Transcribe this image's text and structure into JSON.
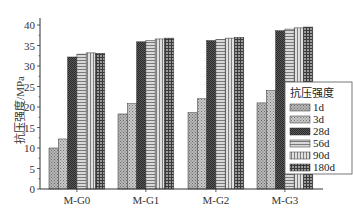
{
  "chart_data": {
    "type": "bar",
    "title": "",
    "xlabel": "",
    "ylabel": "抗压强度/MPa",
    "ylim": [
      0,
      42
    ],
    "yticks": [
      0,
      5,
      10,
      15,
      20,
      25,
      30,
      35,
      40
    ],
    "grid": false,
    "legend_position": "right-inside",
    "legend_title": "抗压强度",
    "categories": [
      "M-G0",
      "M-G1",
      "M-G2",
      "M-G3"
    ],
    "series": [
      {
        "name": "1d",
        "values": [
          10.0,
          18.3,
          18.6,
          21.0
        ],
        "pattern": "dots-light"
      },
      {
        "name": "3d",
        "values": [
          12.2,
          20.8,
          22.0,
          24.0
        ],
        "pattern": "dots-lighter"
      },
      {
        "name": "28d",
        "values": [
          32.2,
          35.9,
          36.2,
          38.6
        ],
        "pattern": "checker-dark"
      },
      {
        "name": "56d",
        "values": [
          32.9,
          36.2,
          36.5,
          39.0
        ],
        "pattern": "horizontal-lines"
      },
      {
        "name": "90d",
        "values": [
          33.2,
          36.6,
          36.8,
          39.3
        ],
        "pattern": "vertical-lines"
      },
      {
        "name": "180d",
        "values": [
          33.1,
          36.8,
          37.0,
          39.5
        ],
        "pattern": "grid-dark"
      }
    ]
  }
}
